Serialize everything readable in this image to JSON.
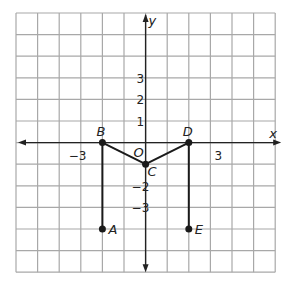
{
  "diagram": {
    "type": "coordinate-grid",
    "grid": {
      "xmin": -6,
      "xmax": 6,
      "ymin": -6,
      "ymax": 6,
      "cell_px": 21.6,
      "left_px": 16,
      "top_px": 13
    },
    "axes": {
      "x_label": "x",
      "y_label": "y",
      "origin_label": "O"
    },
    "x_ticks": [
      {
        "value": -3,
        "label": "−3"
      },
      {
        "value": 3,
        "label": "3"
      }
    ],
    "y_ticks": [
      {
        "value": 3,
        "label": "3"
      },
      {
        "value": 2,
        "label": "2"
      },
      {
        "value": 1,
        "label": "1"
      },
      {
        "value": -2,
        "label": "−2"
      },
      {
        "value": -3,
        "label": "−3"
      }
    ],
    "points": [
      {
        "name": "A",
        "x": -2,
        "y": -4
      },
      {
        "name": "B",
        "x": -2,
        "y": 0
      },
      {
        "name": "C",
        "x": 0,
        "y": -1
      },
      {
        "name": "D",
        "x": 2,
        "y": 0
      },
      {
        "name": "E",
        "x": 2,
        "y": -4
      }
    ],
    "segments": [
      [
        "A",
        "B"
      ],
      [
        "B",
        "C"
      ],
      [
        "C",
        "D"
      ],
      [
        "D",
        "E"
      ]
    ],
    "colors": {
      "grid": "#a8a8a8",
      "axis": "#222222",
      "figure": "#1a1a1a",
      "background": "#ffffff"
    }
  }
}
